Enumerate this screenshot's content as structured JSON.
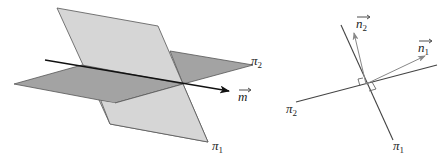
{
  "figure": {
    "left": {
      "description": "Two intersecting planes with their line of intersection directed by vector m",
      "planes": [
        {
          "name": "pi1",
          "label": "π",
          "subscript": "1",
          "color": "#d6d6d6"
        },
        {
          "name": "pi2",
          "label": "π",
          "subscript": "2",
          "color": "#a3a3a3"
        }
      ],
      "line": {
        "name": "m",
        "label": "m"
      },
      "edge_color": "#555555"
    },
    "right": {
      "description": "Cross-section view: traces of planes with normal vectors perpendicular",
      "lines": [
        {
          "name": "pi1",
          "label": "π",
          "subscript": "1"
        },
        {
          "name": "pi2",
          "label": "π",
          "subscript": "2"
        }
      ],
      "vectors": [
        {
          "name": "n1",
          "label": "n",
          "subscript": "1"
        },
        {
          "name": "n2",
          "label": "n",
          "subscript": "2"
        }
      ],
      "line_color": "#444444",
      "vector_color": "#888888"
    }
  }
}
